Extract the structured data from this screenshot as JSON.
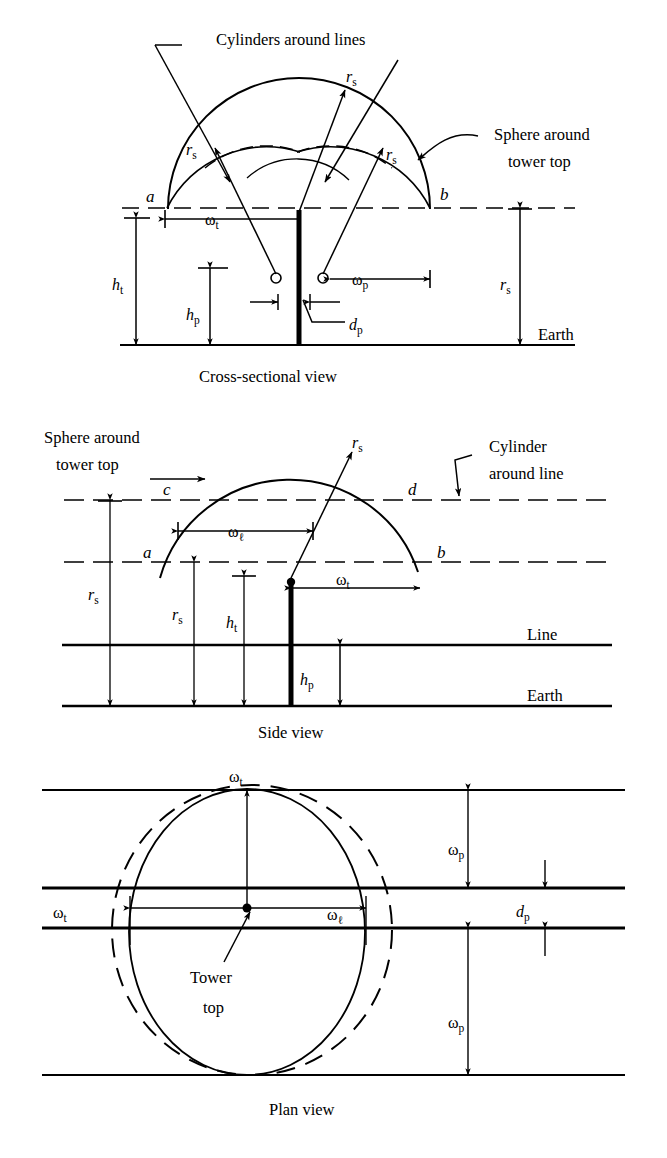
{
  "figure": {
    "colors": {
      "ink": "#000000",
      "paper": "#ffffff"
    }
  },
  "views": [
    {
      "id": "cross-sectional",
      "caption": "Cross-sectional view",
      "annotations": [
        {
          "name": "cylinders-around-lines",
          "text": "Cylinders around lines"
        },
        {
          "name": "sphere-around-tower-top-line1",
          "text": "Sphere around"
        },
        {
          "name": "sphere-around-tower-top-line2",
          "text": "tower top"
        },
        {
          "name": "earth",
          "text": "Earth"
        }
      ],
      "points": [
        {
          "name": "point-a",
          "text": "a"
        },
        {
          "name": "point-b",
          "text": "b"
        }
      ],
      "symbols": [
        {
          "name": "rs-top",
          "base": "r",
          "sub": "s"
        },
        {
          "name": "rs-left",
          "base": "r",
          "sub": "s"
        },
        {
          "name": "rs-right",
          "base": "r",
          "sub": "s"
        },
        {
          "name": "rs-earth",
          "base": "r",
          "sub": "s"
        },
        {
          "name": "omega-t",
          "base": "ω",
          "sub": "t"
        },
        {
          "name": "omega-p",
          "base": "ω",
          "sub": "p"
        },
        {
          "name": "h-t",
          "base": "h",
          "sub": "t"
        },
        {
          "name": "h-p",
          "base": "h",
          "sub": "p"
        },
        {
          "name": "d-p",
          "base": "d",
          "sub": "p"
        }
      ]
    },
    {
      "id": "side",
      "caption": "Side view",
      "annotations": [
        {
          "name": "sphere-around-tower-top-line1",
          "text": "Sphere around"
        },
        {
          "name": "sphere-around-tower-top-line2",
          "text": "tower top"
        },
        {
          "name": "cylinder-around-line-line1",
          "text": "Cylinder"
        },
        {
          "name": "cylinder-around-line-line2",
          "text": "around line"
        },
        {
          "name": "line",
          "text": "Line"
        },
        {
          "name": "earth",
          "text": "Earth"
        }
      ],
      "points": [
        {
          "name": "point-a",
          "text": "a"
        },
        {
          "name": "point-b",
          "text": "b"
        },
        {
          "name": "point-c",
          "text": "c"
        },
        {
          "name": "point-d",
          "text": "d"
        }
      ],
      "symbols": [
        {
          "name": "rs-arc",
          "base": "r",
          "sub": "s"
        },
        {
          "name": "rs-outer",
          "base": "r",
          "sub": "s"
        },
        {
          "name": "rs-inner",
          "base": "r",
          "sub": "s"
        },
        {
          "name": "omega-l",
          "base": "ω",
          "sub": "ℓ"
        },
        {
          "name": "omega-t",
          "base": "ω",
          "sub": "t"
        },
        {
          "name": "h-t",
          "base": "h",
          "sub": "t"
        },
        {
          "name": "h-p",
          "base": "h",
          "sub": "p"
        }
      ]
    },
    {
      "id": "plan",
      "caption": "Plan view",
      "annotations": [
        {
          "name": "tower-top-line1",
          "text": "Tower"
        },
        {
          "name": "tower-top-line2",
          "text": "top"
        }
      ],
      "symbols": [
        {
          "name": "omega-t-top",
          "base": "ω",
          "sub": "t"
        },
        {
          "name": "omega-t-left",
          "base": "ω",
          "sub": "t"
        },
        {
          "name": "omega-l-right",
          "base": "ω",
          "sub": "ℓ"
        },
        {
          "name": "omega-p-upper",
          "base": "ω",
          "sub": "p"
        },
        {
          "name": "omega-p-lower",
          "base": "ω",
          "sub": "p"
        },
        {
          "name": "d-p",
          "base": "d",
          "sub": "p"
        }
      ]
    }
  ]
}
